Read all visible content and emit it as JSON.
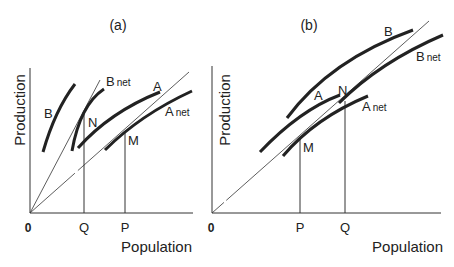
{
  "panels": [
    {
      "id": "a",
      "title": "(a)",
      "xlabel": "Population",
      "ylabel": "Production",
      "origin_label": "0",
      "x_ticks": [
        "Q",
        "P"
      ],
      "curves": [
        {
          "name": "B",
          "label": "B"
        },
        {
          "name": "B_net",
          "label": "B",
          "sub": "net"
        },
        {
          "name": "A",
          "label": "A"
        },
        {
          "name": "A_net",
          "label": "A",
          "sub": "net"
        }
      ],
      "points": [
        "N",
        "M"
      ]
    },
    {
      "id": "b",
      "title": "(b)",
      "xlabel": "Population",
      "ylabel": "Production",
      "origin_label": "0",
      "x_ticks": [
        "P",
        "Q"
      ],
      "curves": [
        {
          "name": "B",
          "label": "B"
        },
        {
          "name": "B_net",
          "label": "B",
          "sub": "net"
        },
        {
          "name": "A",
          "label": "A"
        },
        {
          "name": "A_net",
          "label": "A",
          "sub": "net"
        }
      ],
      "points": [
        "N",
        "M"
      ]
    }
  ]
}
